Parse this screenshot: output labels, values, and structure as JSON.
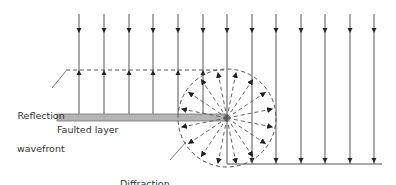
{
  "diagram": {
    "type": "seismic-wave-diffraction",
    "labels": {
      "reflection": [
        "Reflection",
        "wavefront"
      ],
      "faulted_layer": "Faulted layer",
      "diffraction": [
        "Diffraction",
        "wavefront"
      ]
    },
    "colors": {
      "ray": "#555555",
      "layer_fill": "#b4b4b4",
      "layer_stroke": "#777777",
      "dash": "#555555",
      "text": "#333333"
    },
    "rays_x": [
      79,
      104,
      129,
      153,
      178,
      203,
      227,
      252,
      276,
      301,
      325,
      350,
      374
    ],
    "ray_top": 14,
    "down_arrow_y": 31,
    "reflection_y": 70,
    "fault": {
      "x1": 57,
      "x2": 227,
      "y": 114,
      "h": 7
    },
    "diffraction_center": [
      227,
      118
    ],
    "diffraction_radius": 49,
    "bottom_reflector_y": 164,
    "bottom_reflector_x2": 382
  }
}
